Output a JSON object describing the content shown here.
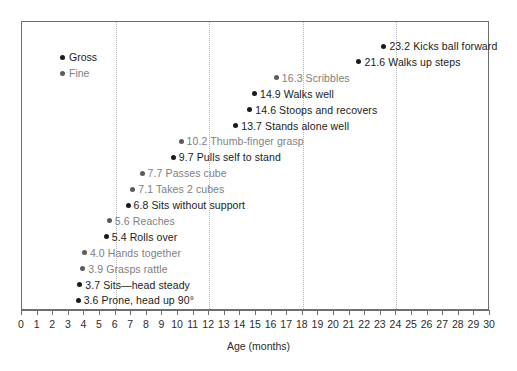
{
  "chart_data": {
    "type": "scatter",
    "title": "",
    "xlabel": "Age (months)",
    "ylabel": "",
    "xlim": [
      0,
      30
    ],
    "xticks": [
      0,
      1,
      2,
      3,
      4,
      5,
      6,
      7,
      8,
      9,
      10,
      11,
      12,
      13,
      14,
      15,
      16,
      17,
      18,
      19,
      20,
      21,
      22,
      23,
      24,
      25,
      26,
      27,
      28,
      29,
      30
    ],
    "xtick_labels": [
      "0",
      "1",
      "2",
      "3",
      "4",
      "5",
      "6",
      "7",
      "8",
      "9",
      "10",
      "11",
      "12",
      "13",
      "14",
      "15",
      "16",
      "17",
      "18",
      "19",
      "20",
      "21",
      "22",
      "23",
      "24",
      "25",
      "26",
      "27",
      "28",
      "29",
      "30"
    ],
    "gridlines_x": [
      6,
      12,
      18,
      24
    ],
    "grid": "vertical-dotted",
    "legend_position": "top-left",
    "legend": [
      {
        "label": "Gross",
        "series": "gross",
        "color": "#1a1a1a"
      },
      {
        "label": "Fine",
        "series": "fine",
        "color": "#808080"
      }
    ],
    "series": [
      {
        "name": "Gross",
        "color": "#1a1a1a",
        "points": [
          {
            "x": 23.2,
            "label": "23.2 Kicks ball forward",
            "row": 0
          },
          {
            "x": 21.6,
            "label": "21.6 Walks up steps",
            "row": 1
          },
          {
            "x": 14.9,
            "label": "14.9 Walks well",
            "row": 3
          },
          {
            "x": 14.6,
            "label": "14.6 Stoops and recovers",
            "row": 4
          },
          {
            "x": 13.7,
            "label": "13.7 Stands alone well",
            "row": 5
          },
          {
            "x": 9.7,
            "label": "9.7 Pulls self to stand",
            "row": 7
          },
          {
            "x": 6.8,
            "label": "6.8 Sits without support",
            "row": 10
          },
          {
            "x": 5.4,
            "label": "5.4 Rolls over",
            "row": 12
          },
          {
            "x": 3.7,
            "label": "3.7 Sits—head steady",
            "row": 15
          },
          {
            "x": 3.6,
            "label": "3.6 Prone, head up 90°",
            "row": 16
          }
        ]
      },
      {
        "name": "Fine",
        "color": "#808080",
        "points": [
          {
            "x": 16.3,
            "label": "16.3 Scribbles",
            "row": 2
          },
          {
            "x": 10.2,
            "label": "10.2 Thumb-finger grasp",
            "row": 6
          },
          {
            "x": 7.7,
            "label": "7.7 Passes cube",
            "row": 8
          },
          {
            "x": 7.1,
            "label": "7.1 Takes 2 cubes",
            "row": 9
          },
          {
            "x": 5.6,
            "label": "5.6 Reaches",
            "row": 11
          },
          {
            "x": 4.0,
            "label": "4.0 Hands together",
            "row": 13
          },
          {
            "x": 3.9,
            "label": "3.9 Grasps rattle",
            "row": 14
          }
        ]
      }
    ],
    "points_ordered": [
      {
        "x": 23.2,
        "label": "23.2 Kicks ball forward",
        "series": "gross"
      },
      {
        "x": 21.6,
        "label": "21.6 Walks up steps",
        "series": "gross"
      },
      {
        "x": 16.3,
        "label": "16.3 Scribbles",
        "series": "fine"
      },
      {
        "x": 14.9,
        "label": "14.9 Walks well",
        "series": "gross"
      },
      {
        "x": 14.6,
        "label": "14.6 Stoops and recovers",
        "series": "gross"
      },
      {
        "x": 13.7,
        "label": "13.7 Stands alone well",
        "series": "gross"
      },
      {
        "x": 10.2,
        "label": "10.2 Thumb-finger grasp",
        "series": "fine"
      },
      {
        "x": 9.7,
        "label": "9.7 Pulls self to stand",
        "series": "gross"
      },
      {
        "x": 7.7,
        "label": "7.7 Passes cube",
        "series": "fine"
      },
      {
        "x": 7.1,
        "label": "7.1 Takes 2 cubes",
        "series": "fine"
      },
      {
        "x": 6.8,
        "label": "6.8 Sits without support",
        "series": "gross"
      },
      {
        "x": 5.6,
        "label": "5.6 Reaches",
        "series": "fine"
      },
      {
        "x": 5.4,
        "label": "5.4 Rolls over",
        "series": "gross"
      },
      {
        "x": 4.0,
        "label": "4.0 Hands together",
        "series": "fine"
      },
      {
        "x": 3.9,
        "label": "3.9 Grasps rattle",
        "series": "fine"
      },
      {
        "x": 3.7,
        "label": "3.7 Sits—head steady",
        "series": "gross"
      },
      {
        "x": 3.6,
        "label": "3.6 Prone, head up 90°",
        "series": "gross"
      }
    ]
  }
}
